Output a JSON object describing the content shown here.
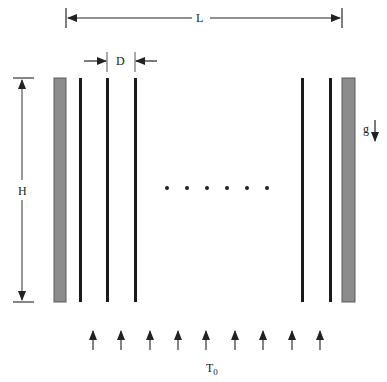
{
  "diagram": {
    "type": "parallel-plate-channel-array",
    "labels": {
      "length": "L",
      "spacing": "D",
      "height": "H",
      "gravity": "g",
      "inlet_temperature": "T",
      "inlet_temperature_subscript": "0"
    },
    "colors": {
      "wall_fill": "#8c8c8c",
      "wall_stroke": "#555555",
      "plate": "#1a1a1a",
      "line": "#333333",
      "dot": "#222222"
    },
    "elements": {
      "left_wall": {
        "x": 54,
        "y": 78,
        "w": 12,
        "h": 224
      },
      "right_wall": {
        "x": 342,
        "y": 78,
        "w": 13,
        "h": 224
      },
      "plates_x": [
        80,
        107,
        135,
        302,
        330
      ],
      "plate_top": 78,
      "plate_bottom": 302,
      "ellipsis_dots_x": [
        167,
        187,
        207,
        227,
        247,
        267
      ],
      "ellipsis_y": 188,
      "inflow_arrows_x": [
        93,
        121,
        150,
        178,
        206,
        235,
        263,
        292,
        320
      ],
      "inflow_arrow_y_top": 330,
      "inflow_arrow_y_bottom": 350
    }
  }
}
